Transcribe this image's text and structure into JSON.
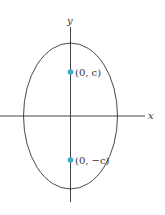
{
  "diagram": {
    "type": "ellipse-vertical-major-axis",
    "axes": {
      "x_label": "x",
      "y_label": "y"
    },
    "foci": [
      {
        "label": "(0, c)",
        "color": "#3aa8cc"
      },
      {
        "label": "(0, −c)",
        "color": "#3aa8cc"
      }
    ],
    "colors": {
      "stroke": "#333333",
      "focus": "#3aa8cc"
    }
  }
}
